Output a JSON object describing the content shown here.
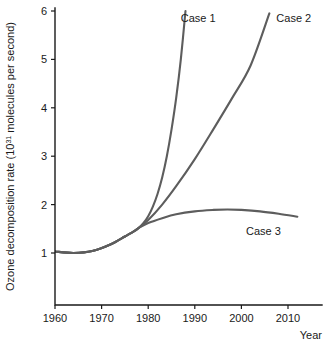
{
  "chart_data": {
    "type": "line",
    "title": "",
    "xlabel": "Year",
    "ylabel_main": "Ozone decomposition rate (10",
    "ylabel_exponent": "31",
    "ylabel_tail": " molecules per second)",
    "ylabel_full": "Ozone decomposition rate (10³¹ molecules per second)",
    "xlim": [
      1960,
      2012
    ],
    "ylim": [
      0,
      6
    ],
    "xticks": [
      1960,
      1970,
      1980,
      1990,
      2000,
      2010
    ],
    "xtick_labels": [
      "1960",
      "1970",
      "1980",
      "1990",
      "2000",
      "2010"
    ],
    "yticks": [
      1,
      2,
      3,
      4,
      5,
      6
    ],
    "ytick_labels": [
      "1",
      "2",
      "3",
      "4",
      "5",
      "6"
    ],
    "grid": false,
    "legend_position": "inline-annotations",
    "curve_color": "#5d5d5d",
    "axis_color": "#1a1a1a",
    "series": [
      {
        "name": "Case 1",
        "label": "Case 1",
        "label_x": 1987,
        "label_y": 5.78,
        "x": [
          1960,
          1964,
          1968,
          1972,
          1975,
          1977,
          1978,
          1979,
          1980,
          1981,
          1982,
          1983,
          1984,
          1985,
          1986,
          1987,
          1988
        ],
        "values": [
          1.03,
          1.0,
          1.04,
          1.18,
          1.34,
          1.45,
          1.52,
          1.62,
          1.76,
          1.96,
          2.22,
          2.56,
          3.0,
          3.55,
          4.2,
          5.0,
          6.0
        ]
      },
      {
        "name": "Case 2",
        "label": "Case 2",
        "label_x": 2007.5,
        "label_y": 5.78,
        "x": [
          1960,
          1964,
          1968,
          1972,
          1975,
          1977,
          1978,
          1980,
          1983,
          1986,
          1990,
          1994,
          1998,
          2002,
          2006
        ],
        "values": [
          1.03,
          1.0,
          1.04,
          1.18,
          1.34,
          1.45,
          1.52,
          1.68,
          2.0,
          2.38,
          2.94,
          3.56,
          4.2,
          4.88,
          5.95
        ]
      },
      {
        "name": "Case 3",
        "label": "Case 3",
        "label_x": 2001,
        "label_y": 1.38,
        "x": [
          1960,
          1964,
          1968,
          1972,
          1975,
          1977,
          1978,
          1980,
          1983,
          1986,
          1990,
          1994,
          1997,
          2000,
          2004,
          2008,
          2012
        ],
        "values": [
          1.03,
          1.0,
          1.04,
          1.18,
          1.34,
          1.45,
          1.52,
          1.62,
          1.72,
          1.8,
          1.86,
          1.89,
          1.9,
          1.89,
          1.86,
          1.81,
          1.75
        ]
      }
    ]
  }
}
